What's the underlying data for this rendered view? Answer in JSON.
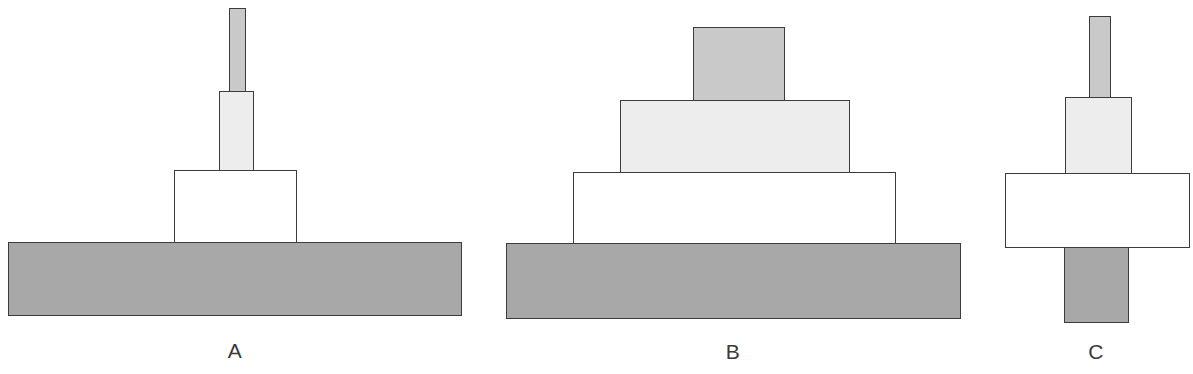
{
  "figure": {
    "width": 1193,
    "height": 374,
    "background": "#ffffff"
  },
  "palette": {
    "slab_dark_gray": "#a8a8a8",
    "bar_medium_gray": "#c9c9c9",
    "block_light_gray": "#ededed",
    "block_white": "#ffffff",
    "outline": "#3c3c3c",
    "label_color": "#3a3a3a"
  },
  "stacks": [
    {
      "id": "stack-a",
      "label": "A",
      "label_x": 235,
      "label_y": 338,
      "blocks": [
        {
          "name": "stack-a-top-bar",
          "shade": "bar_medium_gray",
          "fill": "#c9c9c9",
          "x": 229,
          "y": 8,
          "w": 17,
          "h": 84
        },
        {
          "name": "stack-a-upper-block",
          "shade": "block_light_gray",
          "fill": "#ededed",
          "x": 219,
          "y": 91,
          "w": 35,
          "h": 80
        },
        {
          "name": "stack-a-middle-block",
          "shade": "block_white",
          "fill": "#ffffff",
          "x": 174,
          "y": 170,
          "w": 123,
          "h": 73
        },
        {
          "name": "stack-a-base-slab",
          "shade": "slab_dark_gray",
          "fill": "#a8a8a8",
          "x": 8,
          "y": 242,
          "w": 454,
          "h": 74
        }
      ]
    },
    {
      "id": "stack-b",
      "label": "B",
      "label_x": 733,
      "label_y": 339,
      "blocks": [
        {
          "name": "stack-b-top-block",
          "shade": "bar_medium_gray",
          "fill": "#c9c9c9",
          "x": 693,
          "y": 27,
          "w": 92,
          "h": 74
        },
        {
          "name": "stack-b-upper-block",
          "shade": "block_light_gray",
          "fill": "#ededed",
          "x": 620,
          "y": 100,
          "w": 230,
          "h": 73
        },
        {
          "name": "stack-b-middle-block",
          "shade": "block_white",
          "fill": "#ffffff",
          "x": 573,
          "y": 172,
          "w": 323,
          "h": 72
        },
        {
          "name": "stack-b-base-slab",
          "shade": "slab_dark_gray",
          "fill": "#a8a8a8",
          "x": 506,
          "y": 243,
          "w": 455,
          "h": 76
        }
      ]
    },
    {
      "id": "stack-c",
      "label": "C",
      "label_x": 1096,
      "label_y": 339,
      "blocks": [
        {
          "name": "stack-c-top-bar",
          "shade": "bar_medium_gray",
          "fill": "#c9c9c9",
          "x": 1089,
          "y": 16,
          "w": 22,
          "h": 82
        },
        {
          "name": "stack-c-upper-block",
          "shade": "block_light_gray",
          "fill": "#ededed",
          "x": 1065,
          "y": 97,
          "w": 67,
          "h": 77
        },
        {
          "name": "stack-c-middle-block",
          "shade": "block_white",
          "fill": "#ffffff",
          "x": 1005,
          "y": 173,
          "w": 185,
          "h": 75
        },
        {
          "name": "stack-c-bottom-bar",
          "shade": "slab_dark_gray",
          "fill": "#a8a8a8",
          "x": 1064,
          "y": 247,
          "w": 65,
          "h": 76
        }
      ]
    }
  ]
}
